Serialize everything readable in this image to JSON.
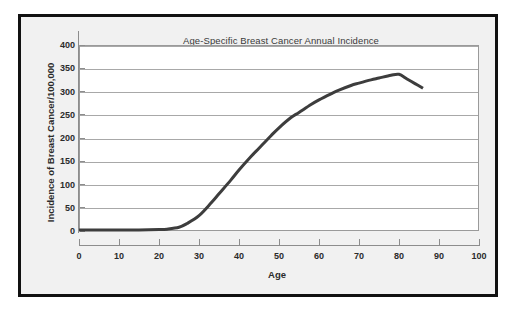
{
  "figure": {
    "background_color": "#f1f1f1",
    "frame_color": "#111111",
    "plot_background": "#ffffff",
    "grid_color": "#a8a8a8",
    "line_color": "#3d3d3d"
  },
  "chart_data": {
    "type": "line",
    "title": "Age-Specific Breast Cancer Annual Incidence",
    "xlabel": "Age",
    "ylabel": "Incidence of Breast Cancer/100,000",
    "xlim": [
      0,
      100
    ],
    "ylim": [
      0,
      400
    ],
    "xticks": [
      0,
      10,
      20,
      30,
      40,
      50,
      60,
      70,
      80,
      90,
      100
    ],
    "xtick_labels": [
      "0",
      "10",
      "20",
      "30",
      "40",
      "50",
      "60",
      "70",
      "80",
      "90",
      "100"
    ],
    "yticks": [
      0,
      50,
      100,
      150,
      200,
      250,
      300,
      350,
      400
    ],
    "ytick_labels": [
      "0",
      "50",
      "100",
      "150",
      "200",
      "250",
      "300",
      "350",
      "400"
    ],
    "grid": "horizontal",
    "legend": "none",
    "series": [
      {
        "name": "Breast cancer incidence",
        "color": "#3d3d3d",
        "line_width": 3,
        "x": [
          0,
          5,
          10,
          15,
          20,
          22,
          25,
          27,
          30,
          33,
          35,
          38,
          40,
          43,
          45,
          48,
          50,
          53,
          55,
          58,
          60,
          63,
          65,
          68,
          70,
          73,
          75,
          78,
          80,
          82,
          84,
          86
        ],
        "values": [
          2,
          2,
          2,
          2,
          3,
          4,
          8,
          16,
          33,
          60,
          80,
          110,
          131,
          160,
          178,
          205,
          222,
          244,
          255,
          272,
          282,
          295,
          303,
          313,
          318,
          325,
          329,
          335,
          337,
          327,
          317,
          307
        ]
      }
    ],
    "annotations": []
  }
}
